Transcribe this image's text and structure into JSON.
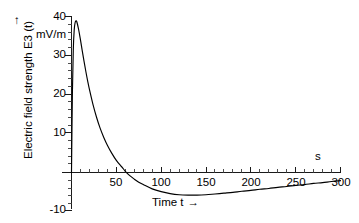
{
  "chart_data": {
    "type": "line",
    "title": "",
    "xlabel": "Time t →",
    "ylabel": "Electric field strength E3 (t) ↑",
    "y_unit": "mV/m",
    "x_unit": "s",
    "xlim": [
      0,
      305
    ],
    "ylim": [
      -10,
      41
    ],
    "grid": false,
    "legend": false,
    "x_ticks_major": [
      50,
      100,
      150,
      200,
      250,
      300
    ],
    "x_tick_labels": [
      "50",
      "100",
      "150",
      "200",
      "250",
      "300"
    ],
    "x_minor_step": 10,
    "y_ticks_major": [
      -10,
      0,
      10,
      20,
      30,
      40
    ],
    "y_tick_labels": [
      "-10",
      "",
      "10",
      "20",
      "30",
      "40"
    ],
    "y_minor_step": 2,
    "series": [
      {
        "name": "E3(t)",
        "color": "#000000",
        "x": [
          0,
          1,
          2,
          3,
          4,
          5,
          6,
          8,
          10,
          12,
          14,
          16,
          18,
          20,
          24,
          28,
          32,
          36,
          40,
          45,
          50,
          55,
          57,
          60,
          65,
          70,
          75,
          80,
          90,
          100,
          110,
          120,
          130,
          140,
          150,
          160,
          170,
          180,
          190,
          200,
          210,
          220,
          230,
          240,
          250,
          260,
          270,
          280,
          290,
          300
        ],
        "y": [
          0,
          20.5,
          31.5,
          36.5,
          38.4,
          38.9,
          38.6,
          36.6,
          34.0,
          31.2,
          28.5,
          25.9,
          23.5,
          21.3,
          17.4,
          14.1,
          11.3,
          9.0,
          7.0,
          4.9,
          3.1,
          1.7,
          1.2,
          0.3,
          -0.8,
          -1.7,
          -2.5,
          -3.1,
          -4.2,
          -4.9,
          -5.4,
          -5.7,
          -5.8,
          -5.8,
          -5.7,
          -5.5,
          -5.3,
          -5.1,
          -4.8,
          -4.6,
          -4.3,
          -4.1,
          -3.8,
          -3.6,
          -3.3,
          -3.1,
          -2.8,
          -2.6,
          -2.3,
          -2.1
        ]
      }
    ],
    "annotations": {
      "peak_value": 38.9,
      "peak_time": 5,
      "zero_crossing_time": 57,
      "minimum_value": -5.8,
      "minimum_time": 133
    }
  },
  "axis_labels": {
    "y_axis_caption": "Electric field strength E3 (t)",
    "y_axis_arrow": "↑",
    "y_axis_unit": "mV/m",
    "x_axis_caption": "Time t",
    "x_axis_arrow": "→",
    "x_axis_unit": "s"
  },
  "colors": {
    "curve": "#000000",
    "axis": "#1a1a1a",
    "background": "#ffffff",
    "text": "#111111"
  }
}
